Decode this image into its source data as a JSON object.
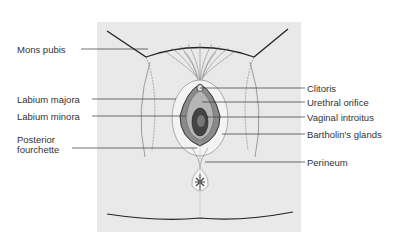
{
  "figure": {
    "type": "anatomical-diagram",
    "panel_color": "#e9e9e9",
    "line_color": "#333333"
  },
  "labels": {
    "left": [
      {
        "text": "Mons pubis",
        "x": 17,
        "y": 44,
        "line_y": 49,
        "line_x1": 81,
        "line_x2": 148
      },
      {
        "text": "Labium majora",
        "x": 17,
        "y": 94,
        "line_y": 99,
        "line_x1": 92,
        "line_x2": 176
      },
      {
        "text": "Labium minora",
        "x": 17,
        "y": 111,
        "line_y": 116,
        "line_x1": 92,
        "line_x2": 186
      },
      {
        "text": "Posterior",
        "x": 17,
        "y": 134
      },
      {
        "text": "fourchette",
        "x": 17,
        "y": 144,
        "line_y": 148,
        "line_x1": 72,
        "line_x2": 197
      }
    ],
    "right": [
      {
        "text": "Clitoris",
        "x": 307,
        "y": 83,
        "line_y": 88,
        "line_x1": 200,
        "line_x2": 305
      },
      {
        "text": "Urethral orifice",
        "x": 307,
        "y": 97,
        "line_y": 102,
        "line_x1": 202,
        "line_x2": 305
      },
      {
        "text": "Vaginal introitus",
        "x": 307,
        "y": 112,
        "line_y": 117,
        "line_x1": 206,
        "line_x2": 305
      },
      {
        "text": "Bartholin's glands",
        "x": 307,
        "y": 129,
        "line_y": 134,
        "line_x1": 222,
        "line_x2": 305
      },
      {
        "text": "Perineum",
        "x": 307,
        "y": 157,
        "line_y": 162,
        "line_x1": 205,
        "line_x2": 305
      }
    ]
  }
}
